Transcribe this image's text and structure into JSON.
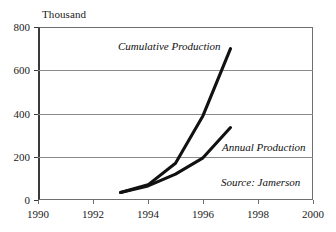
{
  "chart_data": {
    "type": "line",
    "title": "",
    "subtitle": "",
    "xlabel": "",
    "ylabel": "Thousand",
    "unit_caption": "Thousand",
    "xlim": [
      1990,
      2000
    ],
    "ylim": [
      0,
      800
    ],
    "x_ticks": [
      1990,
      1992,
      1994,
      1996,
      1998,
      2000
    ],
    "x_tick_labels": [
      "1990",
      "1992",
      "1994",
      "1996",
      "1998",
      "2000"
    ],
    "y_ticks": [
      0,
      200,
      400,
      600,
      800
    ],
    "y_tick_labels": [
      "0",
      "200",
      "400",
      "600",
      "800"
    ],
    "gridlines": {
      "horizontal": [
        200,
        400,
        600
      ],
      "vertical": [],
      "show": true
    },
    "legend": {
      "position": "inline-annotations",
      "entries": [
        "Cumulative Production",
        "Annual Production"
      ]
    },
    "x": [
      1993,
      1994,
      1995,
      1996,
      1997
    ],
    "series": [
      {
        "name": "Cumulative Production",
        "label": "Cumulative Production",
        "color": "#111111",
        "values": [
          35,
          70,
          170,
          390,
          700
        ]
      },
      {
        "name": "Annual Production",
        "label": "Annual Production",
        "color": "#111111",
        "values": [
          35,
          65,
          120,
          195,
          335
        ]
      }
    ],
    "annotations": [
      {
        "name": "cumulative-label",
        "text": "Cumulative Production"
      },
      {
        "name": "annual-label",
        "text": "Annual Production"
      },
      {
        "name": "source-note",
        "text": "Source: Jamerson"
      }
    ]
  },
  "labels": {
    "unit": "Thousand",
    "cumulative": "Cumulative Production",
    "annual": "Annual Production",
    "source": "Source: Jamerson"
  }
}
